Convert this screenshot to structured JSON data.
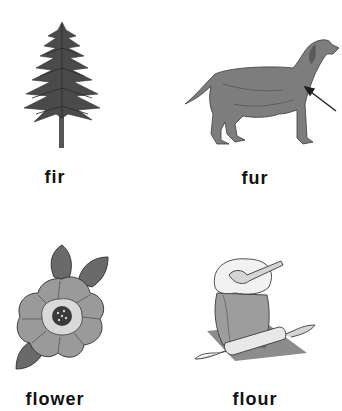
{
  "worksheet": {
    "items": [
      {
        "word": "fir",
        "picture": "fir-tree-icon"
      },
      {
        "word": "fur",
        "picture": "dog-with-arrow-icon"
      },
      {
        "word": "flower",
        "picture": "flower-icon"
      },
      {
        "word": "flour",
        "picture": "flour-sack-icon"
      }
    ]
  },
  "colors": {
    "background": "#ffffff",
    "text": "#111111",
    "illustration_dark": "#3a3a3a",
    "illustration_mid": "#7a7a7a",
    "illustration_light": "#b5b5b5"
  }
}
